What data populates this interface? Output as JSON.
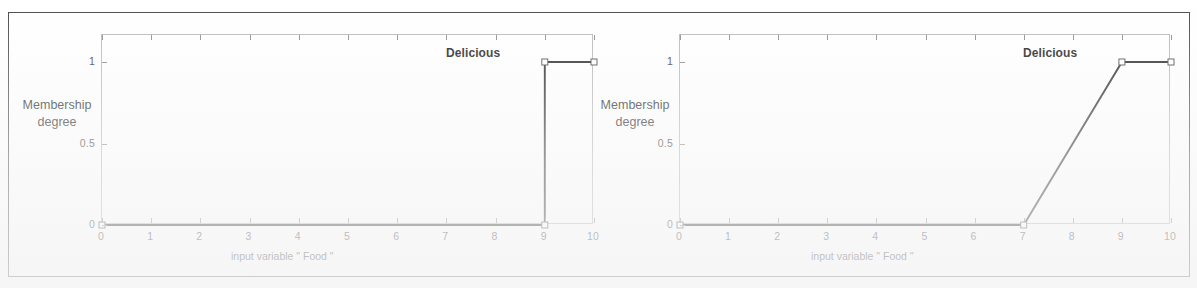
{
  "figure": {
    "background_color": "#ffffff",
    "frame_color": "#4a4a4a",
    "axis_color": "#b9b9b9",
    "curve_color": "#2b2b2b"
  },
  "chart_data": [
    {
      "type": "line",
      "id": "left",
      "title": "",
      "xlabel": "input variable \"  Food  \"",
      "ylabel": "Membership\ndegree",
      "ylabel_line1": "Membership",
      "ylabel_line2": "degree",
      "legend_annotation": "Delicious",
      "xlim": [
        0,
        10
      ],
      "ylim": [
        0,
        1
      ],
      "xticks": [
        0,
        1,
        2,
        3,
        4,
        5,
        6,
        7,
        8,
        9,
        10
      ],
      "xticklabels": [
        "0",
        "1",
        "2",
        "3",
        "4",
        "5",
        "6",
        "7",
        "8",
        "9",
        "10"
      ],
      "yticks": [
        0,
        0.5,
        1
      ],
      "yticklabels": [
        "0",
        "0.5",
        "1"
      ],
      "grid": false,
      "legend_position": "top-right-inside",
      "series": [
        {
          "name": "Delicious",
          "shape": "crisp-step",
          "x": [
            0,
            9,
            9,
            10
          ],
          "y": [
            0,
            0,
            1,
            1
          ]
        }
      ],
      "markers_x": [
        0,
        9,
        9,
        10
      ],
      "markers_y": [
        0,
        0,
        1,
        1
      ]
    },
    {
      "type": "line",
      "id": "right",
      "title": "",
      "xlabel": "input variable \"  Food  \"",
      "ylabel": "Membership\ndegree",
      "ylabel_line1": "Membership",
      "ylabel_line2": "degree",
      "legend_annotation": "Delicious",
      "xlim": [
        0,
        10
      ],
      "ylim": [
        0,
        1
      ],
      "xticks": [
        0,
        1,
        2,
        3,
        4,
        5,
        6,
        7,
        8,
        9,
        10
      ],
      "xticklabels": [
        "0",
        "1",
        "2",
        "3",
        "4",
        "5",
        "6",
        "7",
        "8",
        "9",
        "10"
      ],
      "yticks": [
        0,
        0.5,
        1
      ],
      "yticklabels": [
        "0",
        "0.5",
        "1"
      ],
      "grid": false,
      "legend_position": "top-right-inside",
      "series": [
        {
          "name": "Delicious",
          "shape": "fuzzy-ramp",
          "x": [
            0,
            7,
            9,
            10
          ],
          "y": [
            0,
            0,
            1,
            1
          ]
        }
      ],
      "markers_x": [
        0,
        7,
        9,
        10
      ],
      "markers_y": [
        0,
        0,
        1,
        1
      ]
    }
  ],
  "left_chart": {
    "ylabel_line1": "Membership",
    "ylabel_line2": "degree",
    "xlabel": "input variable \"  Food  \"",
    "mf_label": "Delicious",
    "xticklabels": [
      "0",
      "1",
      "2",
      "3",
      "4",
      "5",
      "6",
      "7",
      "8",
      "9",
      "10"
    ],
    "yticklabels": [
      "0",
      "0.5",
      "1"
    ]
  },
  "right_chart": {
    "ylabel_line1": "Membership",
    "ylabel_line2": "degree",
    "xlabel": "input variable \"  Food  \"",
    "mf_label": "Delicious",
    "xticklabels": [
      "0",
      "1",
      "2",
      "3",
      "4",
      "5",
      "6",
      "7",
      "8",
      "9",
      "10"
    ],
    "yticklabels": [
      "0",
      "0.5",
      "1"
    ]
  }
}
